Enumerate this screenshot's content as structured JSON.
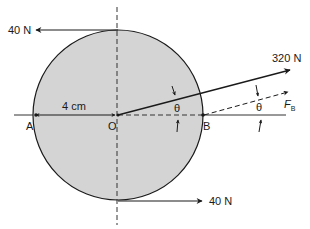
{
  "diagram": {
    "forces": {
      "top": {
        "label": "40 N",
        "direction": "left"
      },
      "bottom": {
        "label": "40 N",
        "direction": "right"
      },
      "oblique": {
        "label": "320 N"
      },
      "fb": {
        "label": "F",
        "subscript": "B"
      }
    },
    "points": {
      "a": "A",
      "o": "O",
      "b": "B"
    },
    "dimension": {
      "label": "4 cm"
    },
    "angles": {
      "theta1": "θ",
      "theta2": "θ"
    },
    "colors": {
      "disk_fill": "#d4d4d4",
      "stroke": "#1a1a1a"
    }
  }
}
